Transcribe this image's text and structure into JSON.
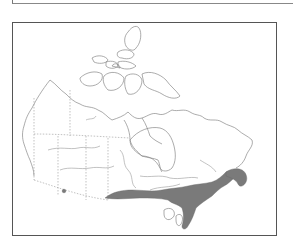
{
  "figure": {
    "type": "species-range-map",
    "region": "Canada",
    "legend": "",
    "title": ""
  },
  "map": {
    "basemap": "Canada outline with provincial/territorial boundaries, lakes and rivers",
    "range_fill_color": "#7a7a7a",
    "outline_color": "#888888",
    "frame_color": "#555555",
    "background_color": "#ffffff",
    "shaded_range": {
      "description": "Southern Canada: from southeastern Manitoba across southern Ontario and southern Quebec to New Brunswick / Maritimes",
      "provinces": [
        "Manitoba (southeast)",
        "Ontario (south)",
        "Quebec (south)",
        "New Brunswick",
        "Nova Scotia"
      ]
    },
    "isolated_occurrence": {
      "description": "Small shaded dot in southern British Columbia / Alberta border area"
    }
  }
}
